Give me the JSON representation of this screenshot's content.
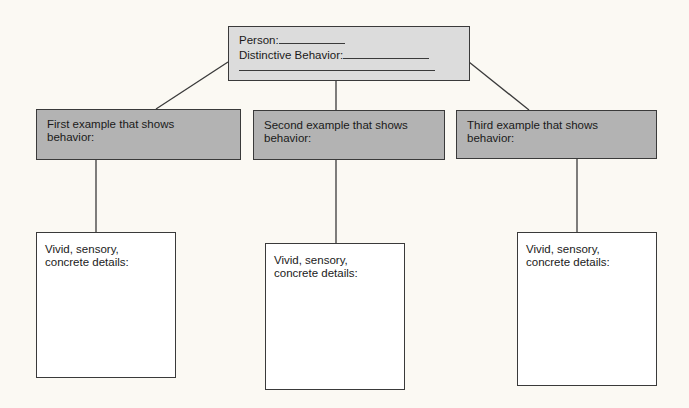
{
  "diagram": {
    "type": "graphic-organizer",
    "colors": {
      "background": "#fbf9f3",
      "top_box_fill": "#dcdcdc",
      "example_box_fill": "#b3b3b3",
      "detail_box_fill": "#ffffff",
      "line": "#3a3a3a"
    },
    "top_box": {
      "person_label": "Person:",
      "behavior_label": "Distinctive Behavior:"
    },
    "examples": [
      {
        "label": "First example that shows behavior:",
        "details_label": "Vivid, sensory, concrete details:"
      },
      {
        "label": "Second example that shows behavior:",
        "details_label": "Vivid, sensory, concrete details:"
      },
      {
        "label": "Third example that shows behavior:",
        "details_label": "Vivid, sensory, concrete details:"
      }
    ]
  }
}
